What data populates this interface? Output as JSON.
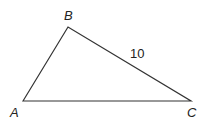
{
  "diagram": {
    "type": "triangle",
    "vertices": {
      "A": {
        "label": "A",
        "x": 23,
        "y": 101
      },
      "B": {
        "label": "B",
        "x": 68,
        "y": 27
      },
      "C": {
        "label": "C",
        "x": 191,
        "y": 101
      }
    },
    "side_labels": {
      "BC": "10"
    },
    "stroke_color": "#333333"
  }
}
